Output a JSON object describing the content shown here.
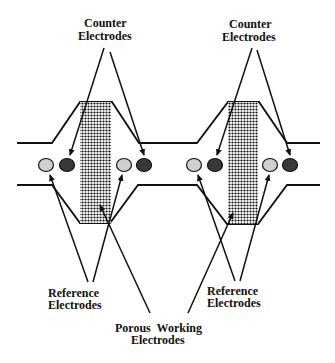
{
  "diagram": {
    "labels": {
      "counter_left_line1": "Counter",
      "counter_left_line2": "Electrodes",
      "counter_right_line1": "Counter",
      "counter_right_line2": "Electrodes",
      "reference_left_line1": "Reference",
      "reference_left_line2": "Electrodes",
      "reference_right_line1": "Reference",
      "reference_right_line2": "Electrodes",
      "porous_working_line1": "Porous  Working",
      "porous_working_line2": "Electrodes"
    },
    "colors": {
      "line": "#111111",
      "reference_fill": "#cfcfcf",
      "counter_fill": "#3a3a3a",
      "porous_dot": "#111111",
      "background": "#ffffff"
    },
    "cells": [
      {
        "name": "left-cell",
        "working_electrode": "porous",
        "reference_electrodes": 2,
        "counter_electrodes": 2
      },
      {
        "name": "right-cell",
        "working_electrode": "porous",
        "reference_electrodes": 2,
        "counter_electrodes": 2
      }
    ]
  }
}
